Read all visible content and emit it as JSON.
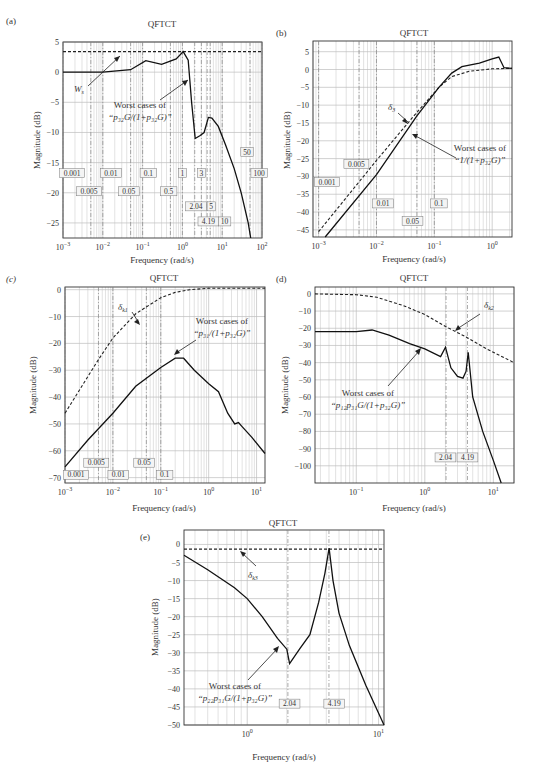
{
  "panels": {
    "a": {
      "letter": "(a)",
      "title": "QFTCT",
      "xlabel": "Frequency (rad/s)",
      "ylabel": "Magnitude (dB)",
      "ann1": "W",
      "ann1_sub": "s",
      "ann2_line1": "Worst cases of",
      "ann2_line2": "“p₃₂G/(1+p₃₂G)”"
    },
    "b": {
      "letter": "(b)",
      "title": "QFTCT",
      "xlabel": "Frequency (rad/s)",
      "ylabel": "Magnitude (dB)",
      "ann1": "δ",
      "ann1_sub": "3",
      "ann2_line1": "Worst cases of",
      "ann2_line2": "“1/(1+p₃₂G)”"
    },
    "c": {
      "letter": "(c)",
      "title": "QFTCT",
      "xlabel": "Frequency (rad/s)",
      "ylabel": "Magnitude (dB)",
      "ann1": "δ",
      "ann1_sub": "k1",
      "ann2_line1": "Worst cases of",
      "ann2_line2": "“p₃₁/(1+p₃₂G)”"
    },
    "d": {
      "letter": "(d)",
      "title": "QFTCT",
      "xlabel": "Frequency (rad/s)",
      "ylabel": "Magnitude (dB)",
      "ann1": "δ",
      "ann1_sub": "k2",
      "ann2_line1": "Worst cases of",
      "ann2_line2": "“p₁₂p₃₁G/(1+p₃₂G)”"
    },
    "e": {
      "letter": "(e)",
      "title": "QFTCT",
      "xlabel": "Frequency (rad/s)",
      "ylabel": "Magnitude (dB)",
      "ann1": "δ",
      "ann1_sub": "k3",
      "ann2_line1": "Worst cases of",
      "ann2_line2": "“p₂₂p₃₁G/(1+p₃₂G)”"
    }
  },
  "chart_data": [
    {
      "id": "a",
      "type": "line",
      "title": "QFTCT",
      "xlabel": "Frequency (rad/s)",
      "ylabel": "Magnitude (dB)",
      "xscale": "log",
      "xlim": [
        0.001,
        100
      ],
      "ylim": [
        -27.5,
        5
      ],
      "xticks": [
        "10^-3",
        "10^-2",
        "10^-1",
        "10^0",
        "10^1",
        "10^2"
      ],
      "yticks": [
        5,
        0,
        -5,
        -10,
        -15,
        -20,
        -25
      ],
      "grid": true,
      "frequency_markers": [
        "0.001",
        "0.005",
        "0.01",
        "0.05",
        "0.1",
        "0.5",
        "1",
        "2.04",
        "3",
        "4.19",
        "5",
        "10",
        "50",
        "100"
      ],
      "series": [
        {
          "name": "W_s (bound)",
          "style": "dashed",
          "x": [
            0.001,
            100
          ],
          "y": [
            3.4,
            3.4
          ]
        },
        {
          "name": "Worst cases of p32G/(1+p32G)",
          "style": "solid",
          "x": [
            0.001,
            0.01,
            0.05,
            0.12,
            0.3,
            0.7,
            1.05,
            1.4,
            1.7,
            2.1,
            2.8,
            3.5,
            4.5,
            5.5,
            8,
            12,
            20,
            30,
            45,
            52
          ],
          "y": [
            0,
            0,
            0.4,
            1.9,
            1.3,
            2.2,
            3.4,
            2.0,
            -5,
            -11,
            -10.5,
            -10.0,
            -7.5,
            -7.6,
            -9,
            -12,
            -16,
            -20,
            -25,
            -27.5
          ]
        }
      ]
    },
    {
      "id": "b",
      "type": "line",
      "title": "QFTCT",
      "xlabel": "Frequency (rad/s)",
      "ylabel": "Magnitude (dB)",
      "xscale": "log",
      "xlim": [
        0.0008,
        2.2
      ],
      "ylim": [
        -47,
        8
      ],
      "xticks": [
        "10^-3",
        "10^-2",
        "10^-1",
        "10^0"
      ],
      "yticks": [
        5,
        0,
        -5,
        -10,
        -15,
        -20,
        -25,
        -30,
        -35,
        -40,
        -45
      ],
      "grid": true,
      "frequency_markers": [
        "0.001",
        "0.005",
        "0.01",
        "0.05",
        "0.1"
      ],
      "series": [
        {
          "name": "delta_3 (bound)",
          "style": "dashed",
          "x": [
            0.001,
            0.01,
            0.05,
            0.12,
            0.2,
            0.4,
            1.0,
            2.2
          ],
          "y": [
            -45.5,
            -25.5,
            -12,
            -5,
            -2,
            -0.5,
            0.2,
            0.3
          ]
        },
        {
          "name": "Worst cases of 1/(1+p32G)",
          "style": "solid",
          "x": [
            0.0013,
            0.01,
            0.05,
            0.12,
            0.2,
            0.3,
            0.6,
            1.0,
            1.3,
            1.6,
            2.2
          ],
          "y": [
            -47,
            -29.5,
            -13,
            -5,
            -1,
            0.8,
            1.8,
            3.0,
            3.5,
            0.5,
            0.3
          ]
        }
      ]
    },
    {
      "id": "c",
      "type": "line",
      "title": "QFTCT",
      "xlabel": "Frequency (rad/s)",
      "ylabel": "Magnitude (dB)",
      "xscale": "log",
      "xlim": [
        0.001,
        15
      ],
      "ylim": [
        -72,
        1
      ],
      "xticks": [
        "10^-3",
        "10^-2",
        "10^-1",
        "10^0",
        "10^1"
      ],
      "yticks": [
        0,
        -10,
        -20,
        -30,
        -40,
        -50,
        -60,
        -70
      ],
      "grid": true,
      "frequency_markers": [
        "0.001",
        "0.005",
        "0.01",
        "0.05",
        "0.1"
      ],
      "series": [
        {
          "name": "delta_k1 (bound)",
          "style": "dashed",
          "x": [
            0.001,
            0.005,
            0.01,
            0.03,
            0.1,
            0.2,
            0.4,
            1,
            15
          ],
          "y": [
            -46,
            -26,
            -18,
            -9,
            -3,
            -1,
            0,
            0.5,
            0.5
          ]
        },
        {
          "name": "Worst cases of p31/(1+p32G)",
          "style": "solid",
          "x": [
            0.001,
            0.003,
            0.01,
            0.03,
            0.1,
            0.2,
            0.3,
            0.5,
            1.0,
            1.6,
            2.5,
            3.5,
            4.2,
            5,
            8,
            15
          ],
          "y": [
            -66,
            -56,
            -46,
            -36,
            -29,
            -25.5,
            -25.5,
            -30,
            -35,
            -38,
            -46,
            -50,
            -49.5,
            -51,
            -55,
            -61
          ]
        }
      ]
    },
    {
      "id": "d",
      "type": "line",
      "title": "QFTCT",
      "xlabel": "Frequency (rad/s)",
      "ylabel": "Magnitude (dB)",
      "xscale": "log",
      "xlim": [
        0.025,
        20
      ],
      "ylim": [
        -110,
        4
      ],
      "xticks": [
        "10^-1",
        "10^0",
        "10^1"
      ],
      "yticks": [
        0,
        -10,
        -20,
        -30,
        -40,
        -50,
        -60,
        -70,
        -80,
        -90,
        -100
      ],
      "grid": true,
      "frequency_markers": [
        "2.04",
        "4.19"
      ],
      "series": [
        {
          "name": "delta_k2 (bound)",
          "style": "dashed",
          "x": [
            0.025,
            0.1,
            0.2,
            0.5,
            1,
            2,
            4,
            8,
            20
          ],
          "y": [
            0,
            -0.5,
            -2,
            -7,
            -12,
            -19,
            -25,
            -32,
            -40
          ]
        },
        {
          "name": "Worst cases of p12p31G/(1+p32G)",
          "style": "solid",
          "x": [
            0.025,
            0.1,
            0.17,
            0.3,
            0.6,
            1.0,
            1.7,
            2.0,
            2.4,
            3.0,
            3.6,
            4.0,
            4.3,
            5,
            7,
            10,
            13
          ],
          "y": [
            -22,
            -22,
            -21,
            -24,
            -29,
            -32,
            -36.5,
            -31,
            -43,
            -48,
            -49,
            -45,
            -34,
            -60,
            -80,
            -97,
            -110
          ]
        }
      ]
    },
    {
      "id": "e",
      "type": "line",
      "title": "QFTCT",
      "xlabel": "Frequency (rad/s)",
      "ylabel": "Magnitude (dB)",
      "xscale": "log",
      "xlim": [
        0.33,
        11
      ],
      "ylim": [
        -50,
        4
      ],
      "xticks": [
        "10^0",
        "10^1"
      ],
      "yticks": [
        0,
        -5,
        -10,
        -15,
        -20,
        -25,
        -30,
        -35,
        -40,
        -45,
        -50
      ],
      "grid": true,
      "frequency_markers": [
        "2.04",
        "4.19"
      ],
      "series": [
        {
          "name": "delta_k3 (bound)",
          "style": "dashed",
          "x": [
            0.33,
            11
          ],
          "y": [
            -1.3,
            -1.3
          ]
        },
        {
          "name": "Worst cases of p22p31G/(1+p32G)",
          "style": "solid",
          "x": [
            0.33,
            0.5,
            0.8,
            1.0,
            1.3,
            1.7,
            2.0,
            2.1,
            2.5,
            3.0,
            3.5,
            3.9,
            4.2,
            4.5,
            5,
            6,
            8,
            11
          ],
          "y": [
            -3,
            -7,
            -12,
            -15,
            -20,
            -26,
            -29,
            -33,
            -29,
            -25,
            -16,
            -8,
            -1,
            -10,
            -19,
            -28,
            -39,
            -50
          ]
        }
      ]
    }
  ]
}
